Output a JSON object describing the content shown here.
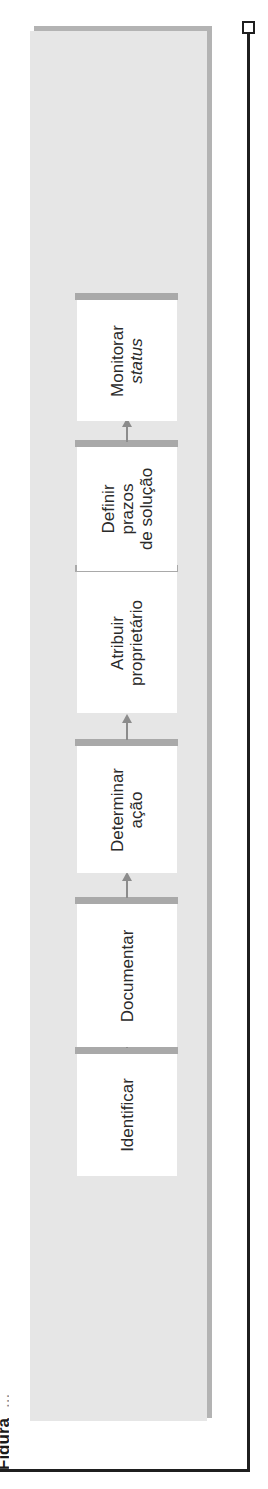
{
  "caption": {
    "figure_label": "Figura",
    "rest": "..."
  },
  "flow": {
    "direction": "bottom-to-top",
    "steps": [
      {
        "id": "identificar",
        "lines": [
          "Identificar"
        ]
      },
      {
        "id": "documentar",
        "lines": [
          "Documentar"
        ]
      },
      {
        "id": "determinar-acao",
        "lines": [
          "Determinar",
          "ação"
        ]
      },
      {
        "id": "atribuir-proprietario",
        "lines": [
          "Atribuir",
          "proprietário"
        ]
      },
      {
        "id": "definir-prazos",
        "lines": [
          "Definir",
          "prazos",
          "de solução"
        ]
      },
      {
        "id": "monitorar-status",
        "lines": [
          "Monitorar",
          "status"
        ],
        "italic_lines": [
          1
        ]
      }
    ]
  },
  "colors": {
    "panel": "#e6e6e6",
    "panel_shadow": "#b3b3b3",
    "box": "#ffffff",
    "bar": "#a9a9a9",
    "arrow": "#8c8c8c",
    "frame": "#1f1f1f",
    "text": "#2a2a2a"
  }
}
